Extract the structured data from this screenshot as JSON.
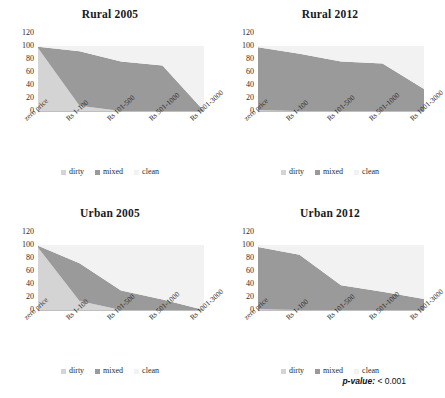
{
  "chart_data": [
    {
      "type": "area",
      "title": "Rural 2005",
      "stacked": true,
      "xlabel": "",
      "ylabel": "",
      "ylim": [
        0,
        120
      ],
      "yticks": [
        0,
        20,
        40,
        60,
        80,
        100,
        120
      ],
      "grid": true,
      "legend_position": "bottom",
      "categories": [
        "zero price",
        "Rs 1-100",
        "Rs 101-500",
        "Rs 501-1000",
        "Rs 1001-3000"
      ],
      "series": [
        {
          "name": "dirty",
          "values": [
            97,
            8,
            0,
            0,
            0
          ]
        },
        {
          "name": "mixed",
          "values": [
            2,
            84,
            76,
            70,
            0
          ]
        },
        {
          "name": "clean",
          "values": [
            1,
            8,
            24,
            30,
            100
          ]
        }
      ]
    },
    {
      "type": "area",
      "title": "Rural 2012",
      "stacked": true,
      "xlabel": "",
      "ylabel": "",
      "ylim": [
        0,
        120
      ],
      "yticks": [
        0,
        20,
        40,
        60,
        80,
        100,
        120
      ],
      "grid": true,
      "legend_position": "bottom",
      "categories": [
        "zero price",
        "Rs 1-100",
        "Rs 101-500",
        "Rs 501-1000",
        "Rs 1001-3000"
      ],
      "series": [
        {
          "name": "dirty",
          "values": [
            1,
            0,
            0,
            0,
            0
          ]
        },
        {
          "name": "mixed",
          "values": [
            97,
            88,
            76,
            73,
            34
          ]
        },
        {
          "name": "clean",
          "values": [
            2,
            12,
            24,
            27,
            66
          ]
        }
      ]
    },
    {
      "type": "area",
      "title": "Urban 2005",
      "stacked": true,
      "xlabel": "",
      "ylabel": "",
      "ylim": [
        0,
        120
      ],
      "yticks": [
        0,
        20,
        40,
        60,
        80,
        100,
        120
      ],
      "grid": true,
      "legend_position": "bottom",
      "categories": [
        "zero price",
        "Rs 1-100",
        "Rs 101-500",
        "Rs 501-1000",
        "Rs 1001-3000"
      ],
      "series": [
        {
          "name": "dirty",
          "values": [
            96,
            14,
            0,
            0,
            0
          ]
        },
        {
          "name": "mixed",
          "values": [
            3,
            58,
            30,
            16,
            0
          ]
        },
        {
          "name": "clean",
          "values": [
            1,
            28,
            70,
            84,
            100
          ]
        }
      ]
    },
    {
      "type": "area",
      "title": "Urban 2012",
      "stacked": true,
      "xlabel": "",
      "ylabel": "",
      "ylim": [
        0,
        120
      ],
      "yticks": [
        0,
        20,
        40,
        60,
        80,
        100,
        120
      ],
      "grid": true,
      "legend_position": "bottom",
      "categories": [
        "zero price",
        "Rs 1-100",
        "Rs 101-500",
        "Rs 501-1000",
        "Rs 1001-3000"
      ],
      "series": [
        {
          "name": "dirty",
          "values": [
            1,
            0,
            0,
            0,
            0
          ]
        },
        {
          "name": "mixed",
          "values": [
            96,
            85,
            38,
            28,
            17
          ]
        },
        {
          "name": "clean",
          "values": [
            3,
            15,
            62,
            72,
            83
          ]
        }
      ]
    }
  ],
  "colors": {
    "dirty": "#d4d4d4",
    "mixed": "#9a9a9a",
    "clean": "#f2f2f2",
    "axis": "#bfbfbf",
    "gridline": "#e8e8e8",
    "text": "#2b2b2b"
  },
  "legend": {
    "items": [
      {
        "label": "dirty"
      },
      {
        "label": "mixed"
      },
      {
        "label": "clean"
      }
    ]
  },
  "annotation": {
    "pvalue_key": "p-value:",
    "pvalue_value": "< 0.001"
  }
}
